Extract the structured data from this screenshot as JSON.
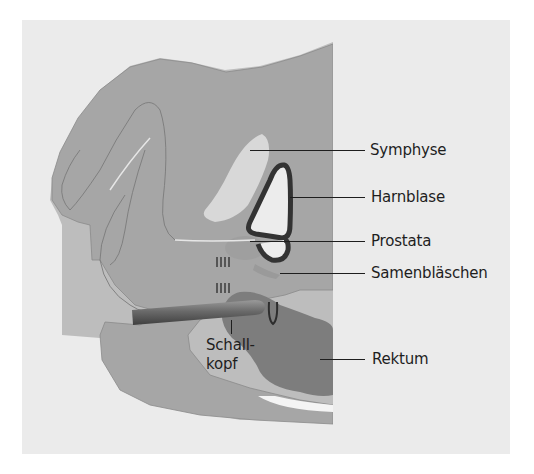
{
  "diagram": {
    "type": "anatomical-cross-section",
    "colors": {
      "background": "#ebebeb",
      "tissue": "#a8a8a8",
      "tissue_light": "#bdbdbd",
      "symphyse": "#d6d6d6",
      "bladder_wall": "#333333",
      "bladder_lumen": "#e8e8e8",
      "rektum": "#7d7d7d",
      "probe": "#6a6a6a",
      "line": "#1e1e1e"
    },
    "labels": [
      {
        "id": "symphyse",
        "text": "Symphyse"
      },
      {
        "id": "harnblase",
        "text": "Harnblase"
      },
      {
        "id": "prostata",
        "text": "Prostata"
      },
      {
        "id": "samenblaeschen",
        "text": "Samenbläschen"
      },
      {
        "id": "rektum",
        "text": "Rektum"
      },
      {
        "id": "schallkopf",
        "text": "Schall-\nkopf",
        "line1": "Schall-",
        "line2": "kopf"
      }
    ]
  }
}
